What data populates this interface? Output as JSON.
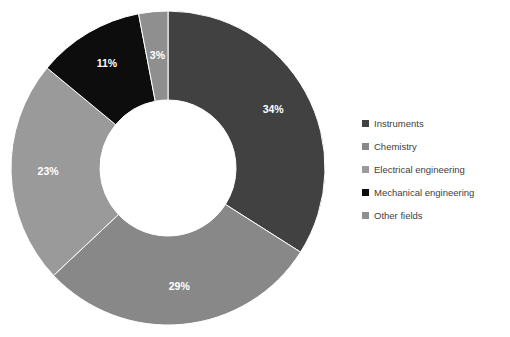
{
  "chart_data": {
    "type": "pie",
    "variant": "donut",
    "title": "",
    "xlabel": "",
    "ylabel": "",
    "legend_position": "right",
    "grid": false,
    "value_unit": "percent",
    "start_angle_deg": 0,
    "direction": "clockwise",
    "categories": [
      "Instruments",
      "Chemistry",
      "Electrical engineering",
      "Mechanical engineering",
      "Other fields"
    ],
    "values": [
      34,
      29,
      23,
      11,
      3
    ],
    "data_labels": [
      "34%",
      "29%",
      "23%",
      "11%",
      "3%"
    ],
    "colors": [
      "#414141",
      "#888888",
      "#9a9a9a",
      "#0d0d0d",
      "#8f8f8f"
    ],
    "slices": [
      {
        "label": "Instruments",
        "value": 34,
        "display": "34%",
        "color": "#414141"
      },
      {
        "label": "Chemistry",
        "value": 29,
        "display": "29%",
        "color": "#888888"
      },
      {
        "label": "Electrical engineering",
        "value": 23,
        "display": "23%",
        "color": "#9a9a9a"
      },
      {
        "label": "Mechanical engineering",
        "value": 11,
        "display": "11%",
        "color": "#0d0d0d"
      },
      {
        "label": "Other fields",
        "value": 3,
        "display": "3%",
        "color": "#8f8f8f"
      }
    ]
  },
  "geometry": {
    "center_x": 168,
    "center_y": 168,
    "outer_radius": 157,
    "inner_radius": 68,
    "label_radius": 120
  },
  "legend": {
    "items": [
      {
        "label": "Instruments",
        "color": "#414141"
      },
      {
        "label": "Chemistry",
        "color": "#888888"
      },
      {
        "label": "Electrical engineering",
        "color": "#9a9a9a"
      },
      {
        "label": "Mechanical engineering",
        "color": "#0d0d0d"
      },
      {
        "label": "Other fields",
        "color": "#8f8f8f"
      }
    ]
  }
}
